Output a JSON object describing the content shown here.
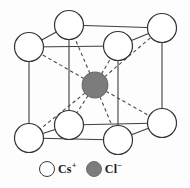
{
  "figure": {
    "kind": "crystal-structure-unit-cell-diagram",
    "canvas": {
      "width": 190,
      "height": 188
    },
    "colors": {
      "background": "#fdfdfd",
      "edge_line": "#3f3f3f",
      "bond_line": "#4a4a4a",
      "corner_ion_fill": "#ffffff",
      "corner_ion_stroke": "#333333",
      "center_ion_fill": "#7c7c7c",
      "center_ion_stroke": "#6d6d6d"
    },
    "corner_ion_radius": 14.5,
    "corner_ions": [
      {
        "id": "back-top-left",
        "x": 69,
        "y": 25
      },
      {
        "id": "back-top-right",
        "x": 162,
        "y": 28
      },
      {
        "id": "front-top-left",
        "x": 29,
        "y": 47
      },
      {
        "id": "front-top-right",
        "x": 118,
        "y": 46
      },
      {
        "id": "back-bottom-left",
        "x": 69,
        "y": 125
      },
      {
        "id": "back-bottom-right",
        "x": 162,
        "y": 123
      },
      {
        "id": "front-bottom-left",
        "x": 29,
        "y": 138
      },
      {
        "id": "front-bottom-right",
        "x": 118,
        "y": 140
      }
    ],
    "center_ion": {
      "id": "body-center",
      "x": 95,
      "y": 85,
      "radius": 12.8
    },
    "cube_edges": [
      [
        "front-top-left",
        "front-top-right"
      ],
      [
        "front-top-right",
        "front-bottom-right"
      ],
      [
        "front-bottom-right",
        "front-bottom-left"
      ],
      [
        "front-bottom-left",
        "front-top-left"
      ],
      [
        "back-top-left",
        "back-top-right"
      ],
      [
        "back-top-right",
        "back-bottom-right"
      ],
      [
        "back-bottom-right",
        "back-bottom-left"
      ],
      [
        "back-bottom-left",
        "back-top-left"
      ],
      [
        "front-top-left",
        "back-top-left"
      ],
      [
        "front-top-right",
        "back-top-right"
      ],
      [
        "front-bottom-left",
        "back-bottom-left"
      ],
      [
        "front-bottom-right",
        "back-bottom-right"
      ]
    ],
    "bonds": {
      "style": "dashed",
      "dash_pattern": "3.5 2.8",
      "from": "body-center",
      "to": "each corner ion"
    }
  },
  "legend": {
    "items": [
      {
        "id": "cs",
        "symbol": "Cs",
        "charge": "+",
        "swatch": "open-circle"
      },
      {
        "id": "cl",
        "symbol": "Cl",
        "charge": "−",
        "swatch": "filled-circle"
      }
    ]
  }
}
